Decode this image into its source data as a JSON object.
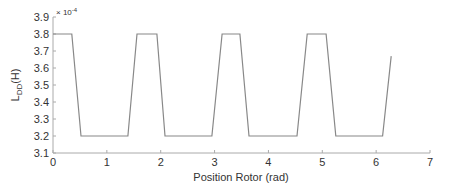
{
  "chart_data": {
    "type": "line",
    "title": "",
    "xlabel": "Position Rotor (rad)",
    "ylabel_main": "L",
    "ylabel_sub": "DD",
    "ylabel_suffix": "(H)",
    "y_exponent_label": "× 10",
    "y_exponent_power": "-4",
    "xlim": [
      0,
      7
    ],
    "ylim": [
      3.1,
      3.9
    ],
    "xticks": [
      0,
      1,
      2,
      3,
      4,
      5,
      6,
      7
    ],
    "yticks": [
      3.1,
      3.2,
      3.3,
      3.4,
      3.5,
      3.6,
      3.7,
      3.8,
      3.9
    ],
    "ytick_labels": [
      "3.1",
      "3.2",
      "3.3",
      "3.4",
      "3.5",
      "3.6",
      "3.7",
      "3.8",
      "3.9"
    ],
    "grid": false,
    "legend": null,
    "line_color": "#888888",
    "axis_color": "#aaaaaa",
    "series": [
      {
        "name": "L_DD",
        "x": [
          0,
          0.35,
          0.52,
          1.39,
          1.56,
          1.93,
          2.08,
          2.95,
          3.14,
          3.47,
          3.64,
          4.53,
          4.72,
          5.07,
          5.25,
          6.12,
          6.28
        ],
        "y": [
          3.8,
          3.8,
          3.2,
          3.2,
          3.8,
          3.8,
          3.2,
          3.2,
          3.8,
          3.8,
          3.2,
          3.2,
          3.8,
          3.8,
          3.2,
          3.2,
          3.67
        ]
      }
    ]
  }
}
